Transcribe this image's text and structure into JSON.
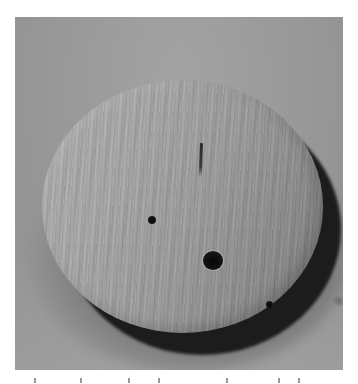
{
  "image": {
    "subject": "round wooden disc with a center hole and two small holes, standing upright on a surface",
    "background_color": "#999999",
    "frame_color": "#ffffff",
    "features": [
      "center-hole",
      "small-hole-left",
      "small-hole-right",
      "radial-crack-top",
      "cast-shadow"
    ]
  },
  "caption": {
    "visible": "clipped"
  }
}
